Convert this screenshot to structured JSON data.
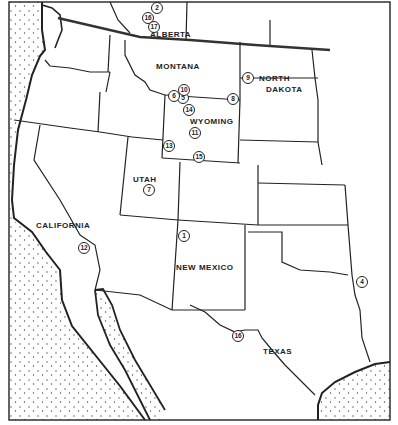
{
  "map": {
    "type": "regional outline map, western North America",
    "colors": {
      "ink": "#222222",
      "land": "#ffffff",
      "water_stipple": "#444444"
    }
  },
  "regions": [
    {
      "name": "ALBERTA",
      "x": 150,
      "y": 30
    },
    {
      "name": "MONTANA",
      "x": 156,
      "y": 62
    },
    {
      "name": "NORTH",
      "x": 259,
      "y": 74
    },
    {
      "name": "DAKOTA",
      "x": 266,
      "y": 85
    },
    {
      "name": "WYOMING",
      "x": 190,
      "y": 117
    },
    {
      "name": "UTAH",
      "x": 133,
      "y": 175
    },
    {
      "name": "CALIFORNIA",
      "x": 36,
      "y": 221
    },
    {
      "name": "NEW MEXICO",
      "x": 176,
      "y": 263
    },
    {
      "name": "TEXAS",
      "x": 263,
      "y": 347
    }
  ],
  "sites": [
    {
      "id": "1",
      "x": 184,
      "y": 236
    },
    {
      "id": "2",
      "x": 157,
      "y": 8
    },
    {
      "id": "4",
      "x": 362,
      "y": 282
    },
    {
      "id": "5",
      "x": 183,
      "y": 98
    },
    {
      "id": "6",
      "x": 174,
      "y": 96
    },
    {
      "id": "7",
      "x": 149,
      "y": 190
    },
    {
      "id": "8",
      "x": 233,
      "y": 99
    },
    {
      "id": "9",
      "x": 248,
      "y": 78
    },
    {
      "id": "10",
      "x": 184,
      "y": 90
    },
    {
      "id": "11",
      "x": 195,
      "y": 133
    },
    {
      "id": "12",
      "x": 84,
      "y": 248
    },
    {
      "id": "13",
      "x": 169,
      "y": 146
    },
    {
      "id": "14",
      "x": 189,
      "y": 110
    },
    {
      "id": "15",
      "x": 199,
      "y": 157
    },
    {
      "id": "16",
      "x": 148,
      "y": 18
    },
    {
      "id": "16",
      "x": 238,
      "y": 336
    },
    {
      "id": "17",
      "x": 154,
      "y": 27
    }
  ]
}
